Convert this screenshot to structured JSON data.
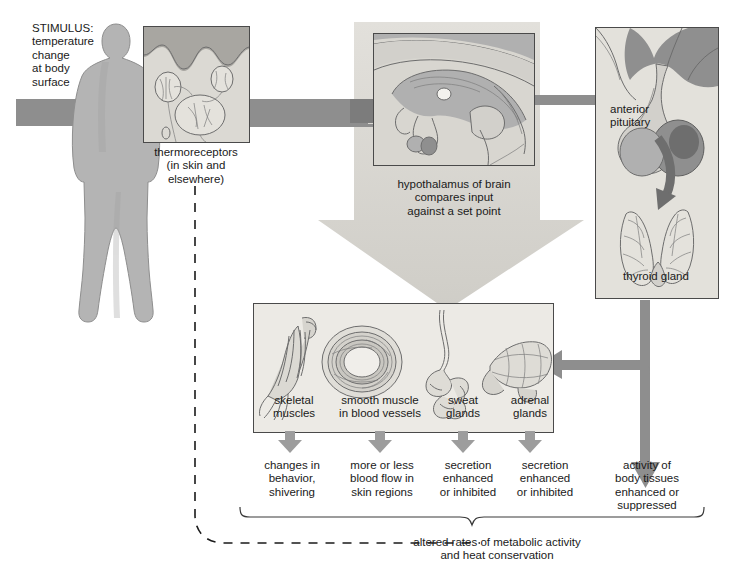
{
  "diagram": {
    "stimulus": {
      "label": "STIMULUS:\ntemperature\nchange\nat body\nsurface"
    },
    "receptor": {
      "label": "thermoreceptors\n(in skin and\nelsewhere)",
      "image_alt": "thermoreceptor-nerve-endings-in-skin"
    },
    "integrator": {
      "label": "hypothalamus of brain\ncompares input\nagainst a set point",
      "image_alt": "midsagittal-brain-hypothalamus"
    },
    "endocrine": {
      "pituitary_label": "anterior\npituitary",
      "thyroid_label": "thyroid gland",
      "image_alt": "anterior-pituitary-and-thyroid-gland"
    },
    "effectors": {
      "items": [
        {
          "label": "skeletal\nmuscles",
          "image_alt": "skeletal-muscle"
        },
        {
          "label": "smooth muscle\nin blood vessels",
          "image_alt": "blood-vessel-cross-section"
        },
        {
          "label": "sweat\nglands",
          "image_alt": "sweat-gland"
        },
        {
          "label": "adrenal\nglands",
          "image_alt": "adrenal-gland"
        }
      ]
    },
    "responses": [
      "changes in\nbehavior,\nshivering",
      "more or less\nblood flow in\nskin regions",
      "secretion\nenhanced\nor inhibited",
      "secretion\nenhanced\nor inhibited",
      "activity of\nbody tissues\nenhanced or\nsuppressed"
    ],
    "feedback": {
      "label": "altered rates of metabolic activity\nand heat conservation"
    },
    "colors": {
      "arrow_gray": "#8e8e8e",
      "arrow_light": "#c9c7c2",
      "panel_bg": "#e9e8e4",
      "panel_border": "#4a4a4a",
      "silhouette": "#b4b4b4",
      "text": "#1a1a1a",
      "page_bg": "#ffffff"
    }
  }
}
